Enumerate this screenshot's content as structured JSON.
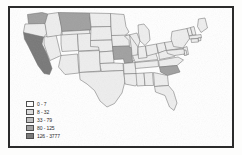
{
  "figure": {
    "type": "choropleth-map",
    "region": "United States",
    "frame_color": "#2b2b2b",
    "background_color": "#ffffff"
  },
  "legend": {
    "name": "map-legend",
    "position": "bottom-left",
    "classes": [
      {
        "label": "0 - 7",
        "color": "#ffffff",
        "min": 0,
        "max": 7
      },
      {
        "label": "8 - 32",
        "color": "#dcdcdc",
        "min": 8,
        "max": 32
      },
      {
        "label": "33 - 79",
        "color": "#c0c0c0",
        "min": 33,
        "max": 79
      },
      {
        "label": "80 - 125",
        "color": "#a0a0a0",
        "min": 80,
        "max": 125
      },
      {
        "label": "126 - 3777",
        "color": "#787878",
        "min": 126,
        "max": 3777
      }
    ]
  },
  "chart_data": {
    "type": "map",
    "title": "",
    "xlabel": "",
    "ylabel": "",
    "legend_position": "bottom-left",
    "grid": false,
    "class_breaks": [
      0,
      7,
      8,
      32,
      33,
      79,
      80,
      125,
      126,
      3777
    ],
    "class_colors": [
      "#ffffff",
      "#dcdcdc",
      "#c0c0c0",
      "#a0a0a0",
      "#787878"
    ],
    "categories": [
      "WA",
      "OR",
      "CA",
      "NV",
      "ID",
      "MT",
      "WY",
      "UT",
      "AZ",
      "CO",
      "NM",
      "ND",
      "SD",
      "NE",
      "KS",
      "OK",
      "TX",
      "MN",
      "IA",
      "MO",
      "AR",
      "LA",
      "WI",
      "IL",
      "MS",
      "AL",
      "TN",
      "KY",
      "IN",
      "MI",
      "OH",
      "WV",
      "VA",
      "NC",
      "SC",
      "GA",
      "FL",
      "PA",
      "NY",
      "ME",
      "VT",
      "NH",
      "MA",
      "RI",
      "CT",
      "NJ",
      "DE",
      "MD"
    ],
    "series": [
      {
        "name": "class index",
        "values": [
          3,
          1,
          4,
          1,
          1,
          3,
          1,
          1,
          1,
          1,
          1,
          1,
          1,
          1,
          1,
          1,
          1,
          1,
          1,
          3,
          1,
          1,
          1,
          1,
          1,
          1,
          1,
          1,
          1,
          1,
          1,
          1,
          1,
          1,
          3,
          1,
          1,
          1,
          1,
          1,
          1,
          1,
          1,
          1,
          1,
          1,
          1,
          1
        ]
      }
    ],
    "highlighted_states": [
      {
        "code": "CA",
        "name": "California",
        "class": "126 - 3777",
        "color": "#787878"
      },
      {
        "code": "WA",
        "name": "Washington",
        "class": "80 - 125",
        "color": "#a0a0a0"
      },
      {
        "code": "MT",
        "name": "Montana",
        "class": "80 - 125",
        "color": "#a0a0a0"
      },
      {
        "code": "MO",
        "name": "Missouri",
        "class": "80 - 125",
        "color": "#a0a0a0"
      },
      {
        "code": "SC",
        "name": "South Carolina",
        "class": "80 - 125",
        "color": "#a0a0a0"
      }
    ],
    "default_state_color": "#eeeeee"
  }
}
